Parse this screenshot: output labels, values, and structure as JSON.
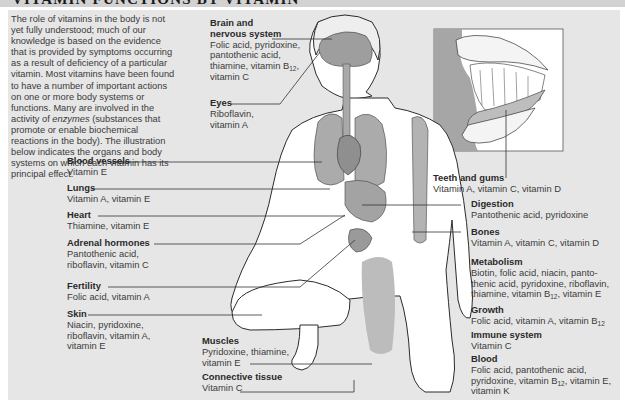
{
  "header": {
    "title": "VITAMIN FUNCTIONS BY VITAMIN"
  },
  "intro": {
    "before_italic": "The role of vitamins in the body is not yet fully understood; much of our knowledge is based on the evidence that is provided by symptoms occurring as a result of deficiency of a particular vitamin. Most vitamins have been found to have a number of important actions on one or more body systems or functions. Many are involved in the activity of ",
    "italic": "enzymes",
    "after_italic": " (substances that promote or enable biochemical reactions in the body). The illustration below indicates the organs and body systems on which each vitamin has its principal effect."
  },
  "labels": {
    "brain": {
      "title_1": "Brain and",
      "title_2": "nervous system",
      "line1": "Folic acid, pyridoxine,",
      "line2": "pantothenic acid,",
      "line3a": "thiamine, vitamin B",
      "line3sub": "12",
      "line3b": ",",
      "line4": "vitamin C"
    },
    "eyes": {
      "title": "Eyes",
      "line1": "Riboflavin,",
      "line2": "vitamin A"
    },
    "blood_vessels": {
      "title": "Blood vessels",
      "line1": "Vitamin E"
    },
    "lungs": {
      "title": "Lungs",
      "line1": "Vitamin A, vitamin E"
    },
    "heart": {
      "title": "Heart",
      "line1": "Thiamine, vitamin E"
    },
    "adrenal": {
      "title": "Adrenal hormones",
      "line1": "Pantothenic acid,",
      "line2": "riboflavin, vitamin C"
    },
    "fertility": {
      "title": "Fertility",
      "line1": "Folic acid, vitamin A"
    },
    "skin": {
      "title": "Skin",
      "line1": "Niacin, pyridoxine,",
      "line2": "riboflavin, vitamin A,",
      "line3": "vitamin E"
    },
    "muscles": {
      "title": "Muscles",
      "line1": "Pyridoxine, thiamine,",
      "line2": "vitamin E"
    },
    "connective": {
      "title": "Connective tissue",
      "line1": "Vitamin C"
    },
    "teeth": {
      "title": "Teeth and gums",
      "line1": "Vitamin A, vitamin C, vitamin D"
    },
    "digestion": {
      "title": "Digestion",
      "line1": "Pantothenic acid, pyridoxine"
    },
    "bones": {
      "title": "Bones",
      "line1": "Vitamin A, vitamin C, vitamin D"
    },
    "metabolism": {
      "title": "Metabolism",
      "line1": "Biotin, folic acid, niacin, panto-",
      "line2": "thenic acid, pyridoxine, riboflavin,",
      "line3a": "thiamine, vitamin B",
      "line3sub": "12",
      "line3b": ", vitamin E"
    },
    "growth": {
      "title": "Growth",
      "line1a": "Folic acid, vitamin A, vitamin B",
      "line1sub": "12"
    },
    "immune": {
      "title": "Immune system",
      "line1": "Vitamin C"
    },
    "blood": {
      "title": "Blood",
      "line1": "Folic acid, pantothenic acid,",
      "line2a": "pyridoxine, vitamin B",
      "line2sub": "12",
      "line2b": ", vitamin E,",
      "line3": "vitamin K"
    }
  },
  "colors": {
    "panel": "#e6e6e6",
    "header": "#d2d2d2",
    "organ": "#a9a9a9",
    "line": "#333333"
  }
}
